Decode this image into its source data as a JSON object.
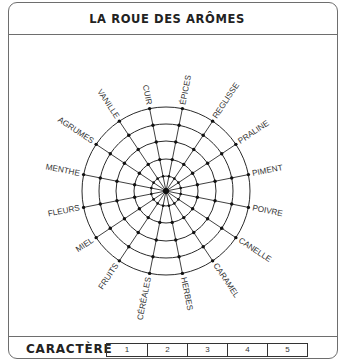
{
  "title": "LA ROUE DES ARÔMES",
  "footer": {
    "label": "CARACTÈRE",
    "scale": [
      "1",
      "2",
      "3",
      "4",
      "5"
    ]
  },
  "wheel": {
    "center": [
      166,
      191
    ],
    "ring_radii": [
      15,
      32,
      50,
      67,
      84
    ],
    "start_angle_deg": 11.25,
    "step_deg": 22.5,
    "line_color": "#2a2a2a",
    "labels_clockwise_from_top_right": [
      "ÉPICES",
      "REGLISSE",
      "PRALINE",
      "PIMENT",
      "POIVRE",
      "CANELLE",
      "CARAMEL",
      "HERBES",
      "CÉRÉALES",
      "FRUITS",
      "MIEL",
      "FLEURS",
      "MENTHE",
      "AGRUMES",
      "VANILLE",
      "CUIR"
    ]
  }
}
